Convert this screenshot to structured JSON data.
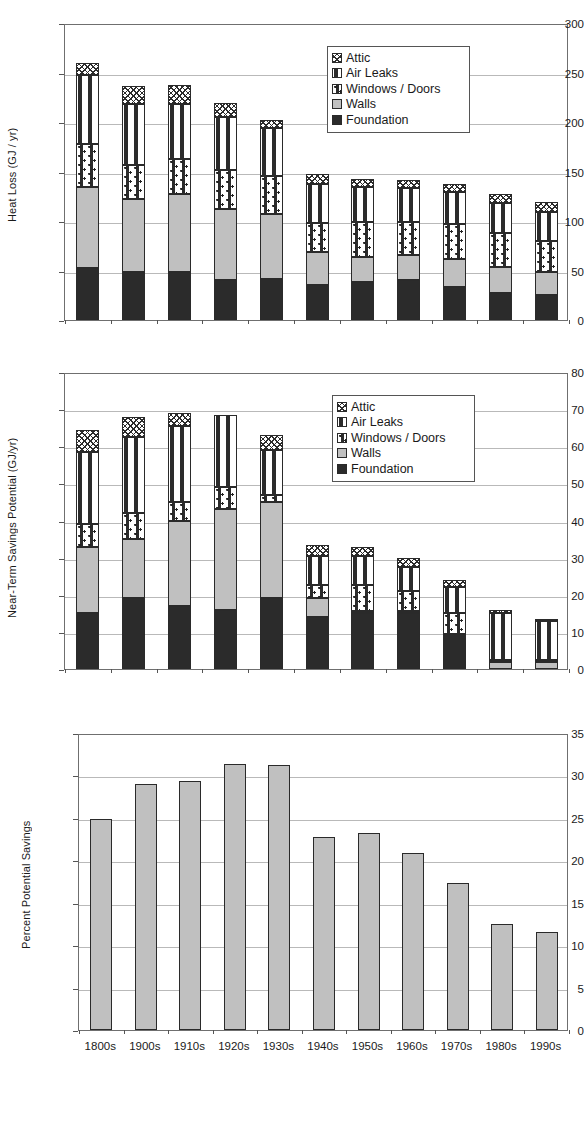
{
  "figure": {
    "categories": [
      "1800s",
      "1900s",
      "1910s",
      "1920s",
      "1930s",
      "1940s",
      "1950s",
      "1960s",
      "1970s",
      "1980s",
      "1990s"
    ],
    "series_names": [
      "Foundation",
      "Walls",
      "Windows / Doors",
      "Air Leaks",
      "Attic"
    ],
    "colors": {
      "foundation": "#2b2b2b",
      "walls": "#c0c0c0",
      "windows_doors": "#ffffff",
      "air_leaks": "#ffffff",
      "attic": "#ffffff",
      "axis": "#555555",
      "grid": "#b9b9b9"
    }
  },
  "panel_a": {
    "label": "(a)",
    "ylabel": "Heat Loss (GJ / yr)",
    "yticks": [
      "0",
      "50",
      "100",
      "150",
      "200",
      "250",
      "300"
    ],
    "legend": [
      "Attic",
      "Air Leaks",
      "Windows / Doors",
      "Walls",
      "Foundation"
    ]
  },
  "panel_b": {
    "label": "(b)",
    "ylabel": "Near-Term Savings Potential (GJ/yr)",
    "yticks": [
      "0",
      "10",
      "20",
      "30",
      "40",
      "50",
      "60",
      "70",
      "80"
    ],
    "legend": [
      "Attic",
      "Air Leaks",
      "Windows / Doors",
      "Walls",
      "Foundation"
    ]
  },
  "panel_c": {
    "label": "(c)",
    "ylabel": "Percent Potential Savings",
    "yticks": [
      "0",
      "5",
      "10",
      "15",
      "20",
      "25",
      "30",
      "35"
    ]
  },
  "chart_data": [
    {
      "type": "bar",
      "id": "panel_a",
      "title": "(a)",
      "stacked": true,
      "xlabel": "",
      "ylabel": "Heat Loss (GJ / yr)",
      "ylim": [
        0,
        300
      ],
      "ytick_step": 50,
      "grid": true,
      "legend_position": "top-right",
      "categories": [
        "1800s",
        "1900s",
        "1910s",
        "1920s",
        "1930s",
        "1940s",
        "1950s",
        "1960s",
        "1970s",
        "1980s",
        "1990s"
      ],
      "series": [
        {
          "name": "Foundation",
          "values": [
            53,
            49,
            48,
            40,
            41,
            35,
            38,
            40,
            33,
            27,
            25
          ]
        },
        {
          "name": "Walls",
          "values": [
            81,
            73,
            79,
            72,
            66,
            34,
            26,
            26,
            29,
            27,
            24
          ]
        },
        {
          "name": "Windows / Doors",
          "values": [
            44,
            35,
            36,
            40,
            38,
            29,
            35,
            33,
            35,
            34,
            31
          ]
        },
        {
          "name": "Air Leaks",
          "values": [
            69,
            61,
            55,
            53,
            49,
            39,
            35,
            34,
            32,
            30,
            29
          ]
        },
        {
          "name": "Attic",
          "values": [
            13,
            18,
            19,
            14,
            8,
            10,
            8,
            8,
            8,
            9,
            10
          ]
        }
      ],
      "totals": [
        260,
        236,
        237,
        219,
        202,
        147,
        142,
        141,
        137,
        127,
        119
      ]
    },
    {
      "type": "bar",
      "id": "panel_b",
      "title": "(b)",
      "stacked": true,
      "xlabel": "",
      "ylabel": "Near-Term Savings Potential (GJ/yr)",
      "ylim": [
        0,
        80
      ],
      "ytick_step": 10,
      "grid": true,
      "legend_position": "top-right",
      "categories": [
        "1800s",
        "1900s",
        "1910s",
        "1920s",
        "1930s",
        "1940s",
        "1950s",
        "1960s",
        "1970s",
        "1980s",
        "1990s"
      ],
      "series": [
        {
          "name": "Foundation",
          "values": [
            15.0,
            19.0,
            17.0,
            16.0,
            19.0,
            14.0,
            15.0,
            15.0,
            9.5,
            0.0,
            0.0
          ]
        },
        {
          "name": "Walls",
          "values": [
            18.0,
            16.0,
            23.0,
            27.0,
            26.0,
            5.0,
            0.5,
            0.5,
            0.0,
            2.0,
            2.0
          ]
        },
        {
          "name": "Windows / Doors",
          "values": [
            6.0,
            7.0,
            5.0,
            6.0,
            2.0,
            3.5,
            7.0,
            5.5,
            5.5,
            0.5,
            0.5
          ]
        },
        {
          "name": "Air Leaks",
          "values": [
            19.5,
            20.5,
            20.5,
            19.5,
            12.0,
            8.0,
            8.0,
            6.5,
            7.0,
            12.5,
            10.5
          ]
        },
        {
          "name": "Attic",
          "values": [
            6.0,
            5.5,
            3.5,
            0.0,
            4.0,
            3.0,
            2.5,
            2.5,
            2.0,
            1.0,
            0.5
          ]
        }
      ],
      "totals": [
        64.5,
        68.0,
        69.0,
        68.5,
        63.0,
        33.5,
        33.0,
        30.0,
        24.0,
        16.0,
        13.5
      ]
    },
    {
      "type": "bar",
      "id": "panel_c",
      "title": "(c)",
      "stacked": false,
      "xlabel": "",
      "ylabel": "Percent Potential Savings",
      "ylim": [
        0,
        35
      ],
      "ytick_step": 5,
      "grid": true,
      "legend_position": "none",
      "categories": [
        "1800s",
        "1900s",
        "1910s",
        "1920s",
        "1930s",
        "1940s",
        "1950s",
        "1960s",
        "1970s",
        "1980s",
        "1990s"
      ],
      "values": [
        24.9,
        29.0,
        29.4,
        31.3,
        31.2,
        22.8,
        23.2,
        20.9,
        17.3,
        12.5,
        11.5
      ]
    }
  ]
}
